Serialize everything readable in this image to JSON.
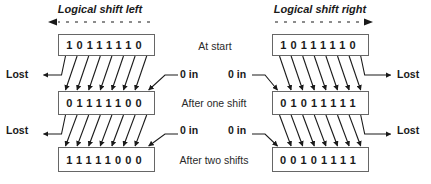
{
  "diagram": {
    "left": {
      "title": "Logical shift left",
      "direction": "left",
      "rows": [
        {
          "bits": [
            "1",
            "0",
            "1",
            "1",
            "1",
            "1",
            "1",
            "0"
          ]
        },
        {
          "bits": [
            "0",
            "1",
            "1",
            "1",
            "1",
            "1",
            "0",
            "0"
          ]
        },
        {
          "bits": [
            "1",
            "1",
            "1",
            "1",
            "1",
            "0",
            "0",
            "0"
          ]
        }
      ],
      "lost_label": "Lost",
      "in_label": "0 in"
    },
    "right": {
      "title": "Logical shift right",
      "direction": "right",
      "rows": [
        {
          "bits": [
            "1",
            "0",
            "1",
            "1",
            "1",
            "1",
            "1",
            "0"
          ]
        },
        {
          "bits": [
            "0",
            "1",
            "0",
            "1",
            "1",
            "1",
            "1",
            "1"
          ]
        },
        {
          "bits": [
            "0",
            "0",
            "1",
            "0",
            "1",
            "1",
            "1",
            "1"
          ]
        }
      ],
      "lost_label": "Lost",
      "in_label": "0 in"
    },
    "stage_labels": [
      "At start",
      "After one shift",
      "After two shifts"
    ],
    "colors": {
      "line": "#1a1a1a",
      "box_border": "#666666",
      "background": "#ffffff"
    }
  }
}
